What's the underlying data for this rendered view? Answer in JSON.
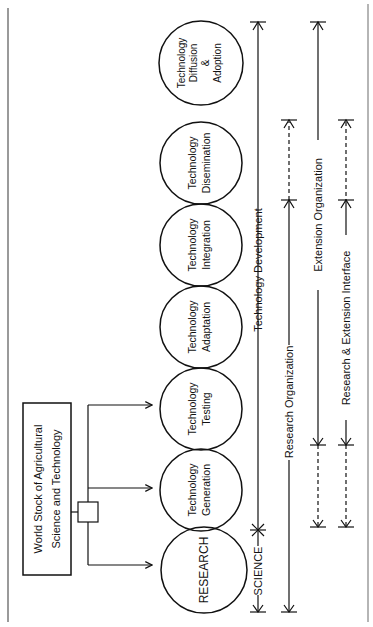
{
  "source_box": {
    "line1": "World  Stock  of  Agricultural",
    "line2": "Science  and  Technology"
  },
  "stages": [
    {
      "id": "research",
      "lines": [
        "RESEARCH"
      ]
    },
    {
      "id": "generation",
      "lines": [
        "Technology",
        "Generation"
      ]
    },
    {
      "id": "testing",
      "lines": [
        "Technology",
        "Testing"
      ]
    },
    {
      "id": "adaptation",
      "lines": [
        "Technology",
        "Adaptation"
      ]
    },
    {
      "id": "integration",
      "lines": [
        "Technology",
        "Integration"
      ]
    },
    {
      "id": "dissemination",
      "lines": [
        "Technology",
        "Disemination"
      ]
    },
    {
      "id": "diffusion",
      "lines": [
        "Technology",
        "Diffusion",
        "&",
        "Adoption"
      ]
    }
  ],
  "spans": {
    "science": "SCIENCE",
    "technology_development": "Technology  Development",
    "research_organization": "Research  Organization",
    "extension_organization": "Extension  Organization",
    "interface": "Research  &  Extension Interface"
  },
  "colors": {
    "ink": "#111111",
    "frame": "#9a9a9a",
    "background": "#ffffff"
  }
}
